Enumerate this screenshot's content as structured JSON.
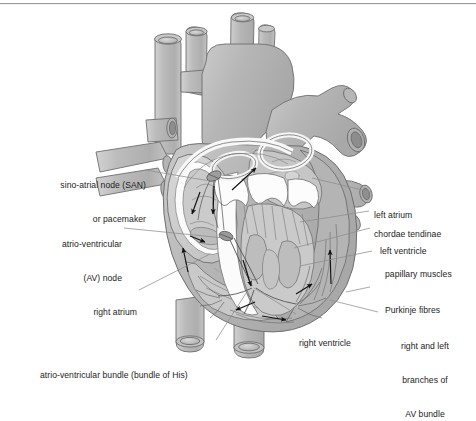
{
  "figure": {
    "type": "anatomical-diagram",
    "border": {
      "top_rule": true,
      "color": "#9a9a9a"
    }
  },
  "palette": {
    "background": "#ffffff",
    "vessel_fill": "#b9b9b9",
    "vessel_fill_light": "#c9c9c9",
    "chamber_fill": "#cfcfcf",
    "muscle_fill": "#bdbdbd",
    "valve_white": "#fbfbfb",
    "outline": "#6e6e6e",
    "outline_dark": "#4a4a4a",
    "arrow": "#111111",
    "leader": "#8c8c8c",
    "text": "#1c1c1c"
  },
  "labels": {
    "left": [
      {
        "id": "san",
        "lines": [
          "sino-atrial node (SAN)",
          "or pacemaker"
        ],
        "align": "right"
      },
      {
        "id": "av-node",
        "lines": [
          "atrio-ventricular",
          "(AV) node"
        ],
        "align": "right"
      },
      {
        "id": "right-atrium",
        "lines": [
          "right atrium"
        ],
        "align": "right"
      }
    ],
    "bottom": [
      {
        "id": "av-bundle",
        "lines": [
          "atrio-ventricular bundle (bundle of His)"
        ],
        "align": "left"
      },
      {
        "id": "right-ventricle",
        "lines": [
          "right ventricle"
        ],
        "align": "left"
      }
    ],
    "right": [
      {
        "id": "left-atrium",
        "lines": [
          "left atrium"
        ],
        "align": "left"
      },
      {
        "id": "chordae-tendinae",
        "lines": [
          "chordae tendinae"
        ],
        "align": "left"
      },
      {
        "id": "left-ventricle",
        "lines": [
          "left ventricle"
        ],
        "align": "left"
      },
      {
        "id": "papillary-muscles",
        "lines": [
          "papillary muscles"
        ],
        "align": "left"
      },
      {
        "id": "purkinje-fibres",
        "lines": [
          "Purkinje fibres"
        ],
        "align": "left"
      },
      {
        "id": "av-branches",
        "lines": [
          "right and left",
          "branches of",
          "AV bundle"
        ],
        "align": "center"
      }
    ]
  },
  "text": {
    "san_l1": "sino-atrial node (SAN)",
    "san_l2": "or pacemaker",
    "avnode_l1": "atrio-ventricular",
    "avnode_l2": "(AV) node",
    "right_atrium": "right atrium",
    "av_bundle": "atrio-ventricular bundle (bundle of His)",
    "right_ventricle": "right ventricle",
    "left_atrium": "left atrium",
    "chordae_tendinae": "chordae tendinae",
    "left_ventricle": "left ventricle",
    "papillary_muscles": "papillary muscles",
    "purkinje_fibres": "Purkinje fibres",
    "avbranch_l1": "right and left",
    "avbranch_l2": "branches of",
    "avbranch_l3": "AV bundle"
  },
  "structures": [
    {
      "name": "aorta",
      "kind": "great-vessel"
    },
    {
      "name": "aortic-arch-branches",
      "kind": "great-vessel"
    },
    {
      "name": "superior-vena-cava",
      "kind": "great-vessel"
    },
    {
      "name": "pulmonary-trunk",
      "kind": "great-vessel"
    },
    {
      "name": "pulmonary-veins",
      "kind": "great-vessel"
    },
    {
      "name": "inferior-vena-cava",
      "kind": "great-vessel"
    },
    {
      "name": "descending-aorta",
      "kind": "great-vessel"
    },
    {
      "name": "right-atrium-chamber",
      "kind": "chamber"
    },
    {
      "name": "left-atrium-chamber",
      "kind": "chamber"
    },
    {
      "name": "right-ventricle-chamber",
      "kind": "chamber"
    },
    {
      "name": "left-ventricle-chamber",
      "kind": "chamber"
    },
    {
      "name": "interventricular-septum",
      "kind": "wall"
    },
    {
      "name": "tricuspid-valve",
      "kind": "valve"
    },
    {
      "name": "mitral-valve",
      "kind": "valve"
    },
    {
      "name": "papillary-muscle-group",
      "kind": "muscle"
    },
    {
      "name": "chordae-tendinae-strands",
      "kind": "tendon"
    },
    {
      "name": "sa-node-marker",
      "kind": "conduction"
    },
    {
      "name": "av-node-marker",
      "kind": "conduction"
    },
    {
      "name": "bundle-of-his-path",
      "kind": "conduction"
    },
    {
      "name": "bundle-branch-path",
      "kind": "conduction"
    },
    {
      "name": "purkinje-network",
      "kind": "conduction"
    }
  ],
  "flow_arrows": [
    {
      "id": "arrow-sa-to-atrium",
      "direction": "down"
    },
    {
      "id": "arrow-atrial-spread",
      "direction": "down-left"
    },
    {
      "id": "arrow-to-av-node",
      "direction": "right"
    },
    {
      "id": "arrow-up-left-atrium",
      "direction": "up-right"
    },
    {
      "id": "arrow-septum-down",
      "direction": "down"
    },
    {
      "id": "arrow-apex-left",
      "direction": "left"
    },
    {
      "id": "arrow-apex-right",
      "direction": "right"
    },
    {
      "id": "arrow-lv-wall-up",
      "direction": "up"
    },
    {
      "id": "arrow-rv-wall-up",
      "direction": "up"
    }
  ]
}
